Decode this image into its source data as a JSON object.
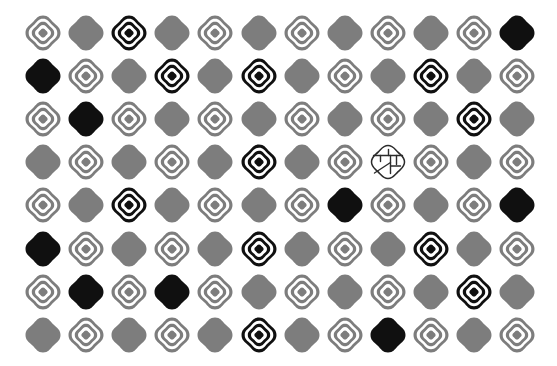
{
  "scene": {
    "title": "Visual search stimulus array",
    "background_color": "#ffffff",
    "gray_color": "#7d7d7d",
    "black_color": "#101010",
    "outline_color": "#2b2b2b",
    "rows": 8,
    "columns": 12,
    "cell_spacing_px": 43.1,
    "origin_x_px": 43,
    "origin_y_px": 33,
    "shape_legend": [
      {
        "code": "gray-ring",
        "label": "gray concentric ring blob"
      },
      {
        "code": "black-ring",
        "label": "black concentric ring blob"
      },
      {
        "code": "gray-solid",
        "label": "gray solid blob"
      },
      {
        "code": "black-solid",
        "label": "black solid blob"
      },
      {
        "code": "outline-sketch",
        "label": "outlined sketch blob with internal lines"
      }
    ],
    "grid": [
      [
        "gray-ring",
        "gray-solid",
        "black-ring",
        "gray-solid",
        "gray-ring",
        "gray-solid",
        "gray-ring",
        "gray-solid",
        "gray-ring",
        "gray-solid",
        "gray-ring",
        "black-solid"
      ],
      [
        "black-solid",
        "gray-ring",
        "gray-solid",
        "black-ring",
        "gray-solid",
        "black-ring",
        "gray-solid",
        "gray-ring",
        "gray-solid",
        "black-ring",
        "gray-solid",
        "gray-ring"
      ],
      [
        "gray-ring",
        "black-solid",
        "gray-ring",
        "gray-solid",
        "gray-ring",
        "gray-solid",
        "gray-ring",
        "gray-solid",
        "gray-ring",
        "gray-solid",
        "black-ring",
        "gray-solid"
      ],
      [
        "gray-solid",
        "gray-ring",
        "gray-solid",
        "gray-ring",
        "gray-solid",
        "black-ring",
        "gray-solid",
        "gray-ring",
        "outline-sketch",
        "gray-ring",
        "gray-solid",
        "gray-ring"
      ],
      [
        "gray-ring",
        "gray-solid",
        "black-ring",
        "gray-solid",
        "gray-ring",
        "gray-solid",
        "gray-ring",
        "black-solid",
        "gray-ring",
        "gray-solid",
        "gray-ring",
        "black-solid"
      ],
      [
        "black-solid",
        "gray-ring",
        "gray-solid",
        "gray-ring",
        "gray-solid",
        "black-ring",
        "gray-solid",
        "gray-ring",
        "gray-solid",
        "black-ring",
        "gray-solid",
        "gray-ring"
      ],
      [
        "gray-ring",
        "black-solid",
        "gray-ring",
        "black-solid",
        "gray-ring",
        "gray-solid",
        "gray-ring",
        "gray-solid",
        "gray-ring",
        "gray-solid",
        "black-ring",
        "gray-solid"
      ],
      [
        "gray-solid",
        "gray-ring",
        "gray-solid",
        "gray-ring",
        "gray-solid",
        "black-ring",
        "gray-solid",
        "gray-ring",
        "black-solid",
        "gray-ring",
        "gray-solid",
        "gray-ring"
      ]
    ]
  }
}
